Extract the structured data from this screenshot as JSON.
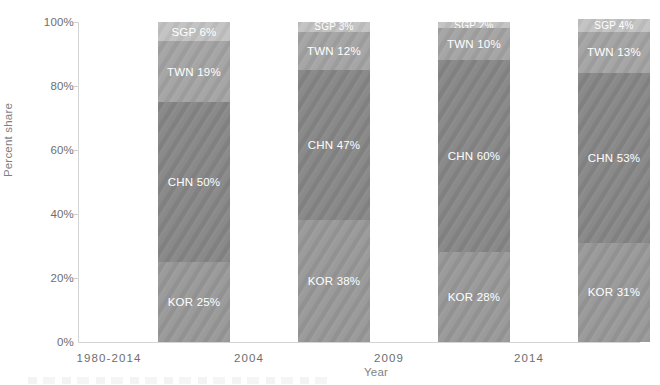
{
  "chart_data": {
    "type": "bar",
    "subtype": "stacked-percent",
    "title": "",
    "xlabel": "Year",
    "ylabel": "Percent share",
    "categories": [
      "1980-2014",
      "2004",
      "2009",
      "2014"
    ],
    "ylim": [
      0,
      100
    ],
    "ytick_labels": [
      "0%",
      "20%",
      "40%",
      "60%",
      "80%",
      "100%"
    ],
    "ytick_values": [
      0,
      20,
      40,
      60,
      80,
      100
    ],
    "grid": false,
    "legend": "none (in-bar data labels)",
    "stack_order_bottom_to_top": [
      "KOR",
      "CHN",
      "TWN",
      "SGP"
    ],
    "series": [
      {
        "name": "KOR",
        "color": "#989898",
        "values": [
          25,
          38,
          28,
          31
        ]
      },
      {
        "name": "CHN",
        "color": "#868686",
        "values": [
          50,
          47,
          60,
          53
        ]
      },
      {
        "name": "TWN",
        "color": "#a3a3a3",
        "values": [
          19,
          12,
          10,
          13
        ]
      },
      {
        "name": "SGP",
        "color": "#c2c2c2",
        "values": [
          6,
          3,
          2,
          4
        ]
      }
    ],
    "data_labels": [
      [
        "KOR 25%",
        "CHN 50%",
        "TWN 19%",
        "SGP 6%"
      ],
      [
        "KOR 38%",
        "CHN 47%",
        "TWN 12%",
        "SGP 3%"
      ],
      [
        "KOR 28%",
        "CHN 60%",
        "TWN 10%",
        "SGP 2%"
      ],
      [
        "KOR 31%",
        "CHN 53%",
        "TWN 13%",
        "SGP 4%"
      ]
    ],
    "colors": {
      "kor": "#989898",
      "chn": "#868686",
      "twn": "#a3a3a3",
      "sgp": "#c2c2c2",
      "axis": "#d4d4d4",
      "tick_text": "#6e6e6e",
      "axis_title_text": "#7f7f7f",
      "label_text": "#ffffff",
      "background": "#ffffff"
    }
  }
}
